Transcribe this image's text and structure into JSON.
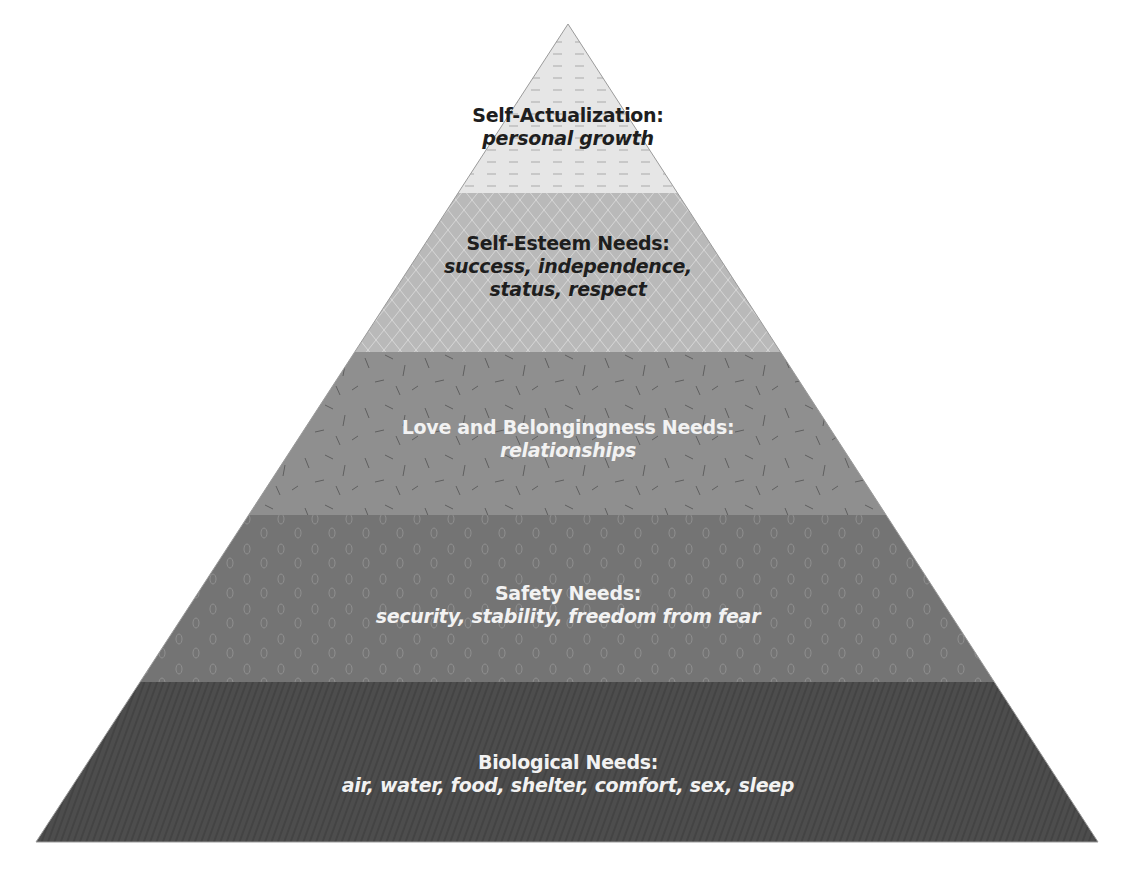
{
  "diagram": {
    "type": "pyramid",
    "apex": {
      "x": 568,
      "y": 24
    },
    "base": {
      "y": 842,
      "left_x": 36,
      "right_x": 1098
    },
    "tiers": [
      {
        "id": "self-actualization",
        "title": "Self-Actualization:",
        "desc_lines": [
          "personal growth"
        ],
        "top_y": 24,
        "bottom_y": 193,
        "fill": "#e6e6e6",
        "pattern_color": "#b4b4b4",
        "pattern": "dashes",
        "text_tone": "dark",
        "label_y": 104
      },
      {
        "id": "self-esteem",
        "title": "Self-Esteem Needs:",
        "desc_lines": [
          "success, independence,",
          "status, respect"
        ],
        "top_y": 193,
        "bottom_y": 352,
        "fill": "#b9b9b9",
        "pattern_color": "#d6d6d6",
        "pattern": "diamond-lattice",
        "text_tone": "dark",
        "label_y": 232
      },
      {
        "id": "love-belongingness",
        "title": "Love and Belongingness Needs:",
        "desc_lines": [
          "relationships"
        ],
        "top_y": 352,
        "bottom_y": 515,
        "fill": "#8f8f8f",
        "pattern_color": "#5e5e5e",
        "pattern": "scattered-strokes",
        "text_tone": "light",
        "label_y": 416
      },
      {
        "id": "safety",
        "title": "Safety Needs:",
        "desc_lines": [
          "security, stability, freedom from fear"
        ],
        "top_y": 515,
        "bottom_y": 682,
        "fill": "#747474",
        "pattern_color": "#8e8e8e",
        "pattern": "ovals",
        "text_tone": "light",
        "label_y": 582
      },
      {
        "id": "biological",
        "title": "Biological Needs:",
        "desc_lines": [
          "air, water, food, shelter, comfort, sex, sleep"
        ],
        "top_y": 682,
        "bottom_y": 842,
        "fill": "#4d4d4d",
        "pattern_color": "#3a3a3a",
        "pattern": "diagonal-hatch",
        "text_tone": "light",
        "label_y": 751
      }
    ]
  }
}
